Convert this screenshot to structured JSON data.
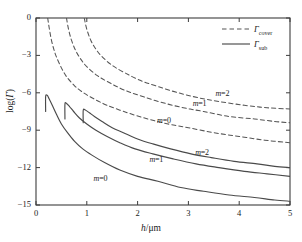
{
  "chart_data": {
    "type": "line",
    "title": "",
    "xlabel": "h/μm",
    "ylabel": "log(Γ)",
    "xlim": [
      0,
      5
    ],
    "ylim": [
      -15,
      0
    ],
    "xticks": [
      "0",
      "1",
      "2",
      "3",
      "4",
      "5"
    ],
    "yticks": [
      "0",
      "−3",
      "−6",
      "−9",
      "−12",
      "−15"
    ],
    "grid": false,
    "legend_position": "top-right",
    "legend": [
      {
        "label": "Γ",
        "sub": "cover",
        "style": "dashed"
      },
      {
        "label": "Γ",
        "sub": "sub",
        "style": "solid"
      }
    ],
    "annotations": [
      {
        "text": "m=2",
        "x": 3.75,
        "y": -6.1,
        "series": "cover_m2"
      },
      {
        "text": "m=1",
        "x": 3.3,
        "y": -6.9,
        "series": "cover_m1"
      },
      {
        "text": "m=0",
        "x": 2.6,
        "y": -8.3,
        "series": "cover_m0"
      },
      {
        "text": "m=2",
        "x": 3.35,
        "y": -10.8,
        "series": "sub_m2"
      },
      {
        "text": "m=1",
        "x": 2.45,
        "y": -11.4,
        "series": "sub_m1"
      },
      {
        "text": "m=0",
        "x": 1.35,
        "y": -12.9,
        "series": "sub_m0"
      }
    ],
    "series": [
      {
        "name": "cover_m0",
        "legend_group": "Γcover",
        "style": "dashed",
        "color": "#555555",
        "points": [
          [
            0.23,
            0.0
          ],
          [
            0.26,
            -0.8
          ],
          [
            0.3,
            -1.7
          ],
          [
            0.35,
            -2.5
          ],
          [
            0.4,
            -3.1
          ],
          [
            0.5,
            -4.0
          ],
          [
            0.6,
            -4.7
          ],
          [
            0.75,
            -5.4
          ],
          [
            0.9,
            -5.9
          ],
          [
            1.1,
            -6.4
          ],
          [
            1.4,
            -7.0
          ],
          [
            1.8,
            -7.6
          ],
          [
            2.2,
            -8.1
          ],
          [
            2.6,
            -8.5
          ],
          [
            3.0,
            -8.8
          ],
          [
            3.5,
            -9.2
          ],
          [
            4.0,
            -9.5
          ],
          [
            4.5,
            -9.8
          ],
          [
            5.0,
            -10.0
          ]
        ]
      },
      {
        "name": "cover_m1",
        "legend_group": "Γcover",
        "style": "dashed",
        "color": "#555555",
        "points": [
          [
            0.6,
            0.0
          ],
          [
            0.64,
            -0.9
          ],
          [
            0.7,
            -1.8
          ],
          [
            0.78,
            -2.6
          ],
          [
            0.88,
            -3.3
          ],
          [
            1.0,
            -3.9
          ],
          [
            1.2,
            -4.6
          ],
          [
            1.45,
            -5.2
          ],
          [
            1.75,
            -5.8
          ],
          [
            2.1,
            -6.3
          ],
          [
            2.5,
            -6.8
          ],
          [
            2.9,
            -7.2
          ],
          [
            3.3,
            -7.5
          ],
          [
            3.8,
            -7.9
          ],
          [
            4.3,
            -8.1
          ],
          [
            4.7,
            -8.3
          ],
          [
            5.0,
            -8.4
          ]
        ]
      },
      {
        "name": "cover_m2",
        "legend_group": "Γcover",
        "style": "dashed",
        "color": "#555555",
        "points": [
          [
            0.95,
            0.0
          ],
          [
            1.0,
            -0.9
          ],
          [
            1.08,
            -1.8
          ],
          [
            1.18,
            -2.5
          ],
          [
            1.3,
            -3.1
          ],
          [
            1.5,
            -3.8
          ],
          [
            1.75,
            -4.4
          ],
          [
            2.05,
            -5.0
          ],
          [
            2.4,
            -5.5
          ],
          [
            2.8,
            -6.0
          ],
          [
            3.2,
            -6.4
          ],
          [
            3.6,
            -6.7
          ],
          [
            4.1,
            -7.0
          ],
          [
            4.55,
            -7.2
          ],
          [
            5.0,
            -7.3
          ]
        ]
      },
      {
        "name": "sub_m0",
        "legend_group": "Γsub",
        "style": "solid",
        "color": "#4a4a4a",
        "points": [
          [
            0.19,
            -7.5
          ],
          [
            0.19,
            -6.3
          ],
          [
            0.22,
            -6.2
          ],
          [
            0.26,
            -6.5
          ],
          [
            0.32,
            -7.0
          ],
          [
            0.4,
            -7.7
          ],
          [
            0.5,
            -8.5
          ],
          [
            0.62,
            -9.2
          ],
          [
            0.76,
            -9.9
          ],
          [
            0.92,
            -10.5
          ],
          [
            1.1,
            -11.0
          ],
          [
            1.35,
            -11.6
          ],
          [
            1.65,
            -12.2
          ],
          [
            2.0,
            -12.7
          ],
          [
            2.4,
            -13.1
          ],
          [
            2.85,
            -13.6
          ],
          [
            3.3,
            -13.9
          ],
          [
            3.8,
            -14.2
          ],
          [
            4.3,
            -14.4
          ],
          [
            4.7,
            -14.6
          ],
          [
            5.0,
            -14.7
          ]
        ]
      },
      {
        "name": "sub_m1",
        "legend_group": "Γsub",
        "style": "solid",
        "color": "#4a4a4a",
        "points": [
          [
            0.57,
            -8.1
          ],
          [
            0.57,
            -6.9
          ],
          [
            0.6,
            -6.85
          ],
          [
            0.66,
            -7.1
          ],
          [
            0.74,
            -7.5
          ],
          [
            0.85,
            -8.0
          ],
          [
            1.0,
            -8.5
          ],
          [
            1.18,
            -9.0
          ],
          [
            1.4,
            -9.5
          ],
          [
            1.65,
            -10.0
          ],
          [
            1.95,
            -10.5
          ],
          [
            2.3,
            -10.9
          ],
          [
            2.7,
            -11.3
          ],
          [
            3.15,
            -11.7
          ],
          [
            3.6,
            -12.0
          ],
          [
            4.1,
            -12.3
          ],
          [
            4.55,
            -12.5
          ],
          [
            5.0,
            -12.7
          ]
        ]
      },
      {
        "name": "sub_m2",
        "legend_group": "Γsub",
        "style": "solid",
        "color": "#4a4a4a",
        "points": [
          [
            0.93,
            -8.4
          ],
          [
            0.93,
            -7.4
          ],
          [
            0.97,
            -7.38
          ],
          [
            1.05,
            -7.6
          ],
          [
            1.15,
            -7.9
          ],
          [
            1.3,
            -8.3
          ],
          [
            1.5,
            -8.8
          ],
          [
            1.72,
            -9.2
          ],
          [
            2.0,
            -9.7
          ],
          [
            2.3,
            -10.1
          ],
          [
            2.65,
            -10.5
          ],
          [
            3.05,
            -10.9
          ],
          [
            3.45,
            -11.2
          ],
          [
            3.9,
            -11.5
          ],
          [
            4.35,
            -11.7
          ],
          [
            4.7,
            -11.9
          ],
          [
            5.0,
            -12.0
          ]
        ]
      }
    ]
  },
  "plot_box": {
    "left": 36,
    "top": 18,
    "right": 290,
    "bottom": 205
  }
}
